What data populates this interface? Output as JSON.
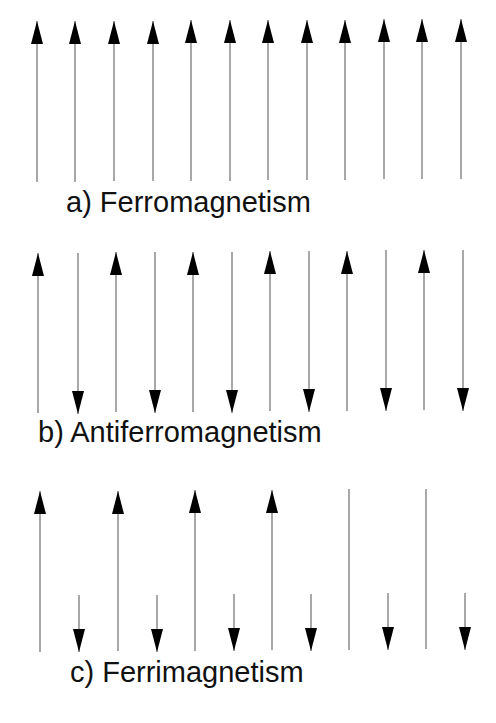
{
  "colors": {
    "background": "#ffffff",
    "shaft": "#6e6e6e",
    "arrowhead": "#000000",
    "text": "#111111"
  },
  "panels": [
    {
      "id": "a",
      "label": "a) Ferromagnetism",
      "label_pos": {
        "x": 66,
        "y": 188
      },
      "arrows": [
        {
          "x": 37,
          "dir": "up",
          "top": 21,
          "bottom": 182,
          "head": true
        },
        {
          "x": 75,
          "dir": "up",
          "top": 21,
          "bottom": 182,
          "head": true
        },
        {
          "x": 114,
          "dir": "up",
          "top": 21,
          "bottom": 181,
          "head": true
        },
        {
          "x": 153,
          "dir": "up",
          "top": 21,
          "bottom": 181,
          "head": true
        },
        {
          "x": 191,
          "dir": "up",
          "top": 20,
          "bottom": 181,
          "head": true
        },
        {
          "x": 230,
          "dir": "up",
          "top": 20,
          "bottom": 181,
          "head": true
        },
        {
          "x": 268,
          "dir": "up",
          "top": 20,
          "bottom": 180,
          "head": true
        },
        {
          "x": 307,
          "dir": "up",
          "top": 20,
          "bottom": 180,
          "head": true
        },
        {
          "x": 345,
          "dir": "up",
          "top": 20,
          "bottom": 180,
          "head": true
        },
        {
          "x": 384,
          "dir": "up",
          "top": 19,
          "bottom": 179,
          "head": true
        },
        {
          "x": 422,
          "dir": "up",
          "top": 19,
          "bottom": 179,
          "head": true
        },
        {
          "x": 461,
          "dir": "up",
          "top": 19,
          "bottom": 179,
          "head": true
        }
      ]
    },
    {
      "id": "b",
      "label": "b) Antiferromagnetism",
      "label_pos": {
        "x": 38,
        "y": 418
      },
      "arrows": [
        {
          "x": 38,
          "dir": "up",
          "top": 253,
          "bottom": 413,
          "head": true
        },
        {
          "x": 78,
          "dir": "down",
          "top": 253,
          "bottom": 414,
          "head": true
        },
        {
          "x": 116,
          "dir": "up",
          "top": 252,
          "bottom": 412,
          "head": true
        },
        {
          "x": 155,
          "dir": "down",
          "top": 252,
          "bottom": 413,
          "head": true
        },
        {
          "x": 193,
          "dir": "up",
          "top": 252,
          "bottom": 412,
          "head": true
        },
        {
          "x": 232,
          "dir": "down",
          "top": 252,
          "bottom": 413,
          "head": true
        },
        {
          "x": 270,
          "dir": "up",
          "top": 251,
          "bottom": 411,
          "head": true
        },
        {
          "x": 309,
          "dir": "down",
          "top": 251,
          "bottom": 412,
          "head": true
        },
        {
          "x": 347,
          "dir": "up",
          "top": 251,
          "bottom": 411,
          "head": true
        },
        {
          "x": 386,
          "dir": "down",
          "top": 250,
          "bottom": 411,
          "head": true
        },
        {
          "x": 424,
          "dir": "up",
          "top": 250,
          "bottom": 410,
          "head": true
        },
        {
          "x": 463,
          "dir": "down",
          "top": 250,
          "bottom": 411,
          "head": true
        }
      ]
    },
    {
      "id": "c",
      "label": "c) Ferrimagnetism",
      "label_pos": {
        "x": 70,
        "y": 658
      },
      "arrows": [
        {
          "x": 40,
          "dir": "up",
          "top": 491,
          "bottom": 652,
          "head": true
        },
        {
          "x": 79,
          "dir": "down",
          "top": 595,
          "bottom": 652,
          "head": true
        },
        {
          "x": 118,
          "dir": "up",
          "top": 491,
          "bottom": 651,
          "head": true
        },
        {
          "x": 157,
          "dir": "down",
          "top": 595,
          "bottom": 652,
          "head": true
        },
        {
          "x": 195,
          "dir": "up",
          "top": 490,
          "bottom": 651,
          "head": true
        },
        {
          "x": 234,
          "dir": "down",
          "top": 594,
          "bottom": 651,
          "head": true
        },
        {
          "x": 272,
          "dir": "up",
          "top": 490,
          "bottom": 650,
          "head": true
        },
        {
          "x": 311,
          "dir": "down",
          "top": 594,
          "bottom": 651,
          "head": true
        },
        {
          "x": 349,
          "dir": "up",
          "top": 489,
          "bottom": 650,
          "head": false
        },
        {
          "x": 388,
          "dir": "down",
          "top": 593,
          "bottom": 650,
          "head": true
        },
        {
          "x": 426,
          "dir": "up",
          "top": 489,
          "bottom": 649,
          "head": false
        },
        {
          "x": 465,
          "dir": "down",
          "top": 593,
          "bottom": 650,
          "head": true
        }
      ]
    }
  ]
}
